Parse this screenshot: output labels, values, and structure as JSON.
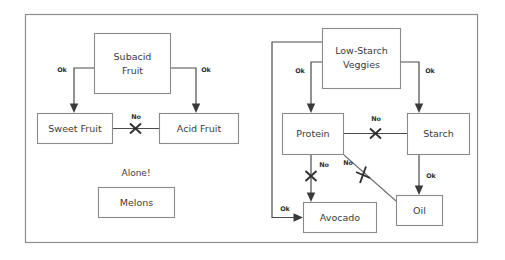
{
  "diagram": {
    "frame": {
      "x": 25,
      "y": 14,
      "width": 453,
      "height": 229
    },
    "colors": {
      "background": "#ffffff",
      "frame_border": "#8d8d8d",
      "node_border": "#8a8a8a",
      "node_fill": "#ffffff",
      "connector": "#4a4a4a",
      "text": "#3b3b3b",
      "mark": "#2f2f2f"
    },
    "nodes": [
      {
        "id": "subacid-fruit",
        "label": "Subacid\nFruit",
        "line1": "Subacid",
        "line2": "Fruit",
        "x": 94,
        "y": 33,
        "width": 77,
        "height": 61
      },
      {
        "id": "sweet-fruit",
        "label": "Sweet Fruit",
        "line1": "Sweet Fruit",
        "line2": "",
        "x": 37,
        "y": 113,
        "width": 76,
        "height": 31
      },
      {
        "id": "acid-fruit",
        "label": "Acid Fruit",
        "line1": "Acid Fruit",
        "line2": "",
        "x": 159,
        "y": 113,
        "width": 80,
        "height": 31
      },
      {
        "id": "melons",
        "label": "Melons",
        "line1": "Melons",
        "line2": "",
        "x": 98,
        "y": 187,
        "width": 77,
        "height": 31
      },
      {
        "id": "low-starch-veggies",
        "label": "Low-Starch\nVeggies",
        "line1": "Low-Starch",
        "line2": "Veggies",
        "x": 322,
        "y": 28,
        "width": 79,
        "height": 61
      },
      {
        "id": "protein",
        "label": "Protein",
        "line1": "Protein",
        "line2": "",
        "x": 282,
        "y": 113,
        "width": 62,
        "height": 42
      },
      {
        "id": "starch",
        "label": "Starch",
        "line1": "Starch",
        "line2": "",
        "x": 407,
        "y": 113,
        "width": 63,
        "height": 42
      },
      {
        "id": "avocado",
        "label": "Avocado",
        "line1": "Avocado",
        "line2": "",
        "x": 303,
        "y": 202,
        "width": 74,
        "height": 31
      },
      {
        "id": "oil",
        "label": "Oil",
        "line1": "Oil",
        "line2": "",
        "x": 396,
        "y": 195,
        "width": 47,
        "height": 31
      }
    ],
    "standalone_note": {
      "text": "Alone!",
      "x": 136,
      "y": 173
    },
    "edges": [
      {
        "id": "subacid-to-sweet",
        "from": "subacid-fruit",
        "to": "sweet-fruit",
        "label": "Ok",
        "verdict": "ok",
        "label_x": 62,
        "label_y": 70
      },
      {
        "id": "subacid-to-acid",
        "from": "subacid-fruit",
        "to": "acid-fruit",
        "label": "Ok",
        "verdict": "ok",
        "label_x": 206,
        "label_y": 70
      },
      {
        "id": "sweet-to-acid",
        "from": "sweet-fruit",
        "to": "acid-fruit",
        "label": "No",
        "verdict": "no",
        "label_x": 136,
        "label_y": 117
      },
      {
        "id": "veggies-to-protein",
        "from": "low-starch-veggies",
        "to": "protein",
        "label": "Ok",
        "verdict": "ok",
        "label_x": 300,
        "label_y": 71
      },
      {
        "id": "veggies-to-starch",
        "from": "low-starch-veggies",
        "to": "starch",
        "label": "Ok",
        "verdict": "ok",
        "label_x": 428,
        "label_y": 71
      },
      {
        "id": "veggies-to-avocado",
        "from": "low-starch-veggies",
        "to": "avocado",
        "label": "Ok",
        "verdict": "ok",
        "label_x": 285,
        "label_y": 209
      },
      {
        "id": "protein-to-starch",
        "from": "protein",
        "to": "starch",
        "label": "No",
        "verdict": "no",
        "label_x": 376,
        "label_y": 119
      },
      {
        "id": "protein-to-avocado",
        "from": "protein",
        "to": "avocado",
        "label": "No",
        "verdict": "no",
        "label_x": 324,
        "label_y": 165
      },
      {
        "id": "protein-to-oil",
        "from": "protein",
        "to": "oil",
        "label": "No",
        "verdict": "no",
        "label_x": 347,
        "label_y": 163
      },
      {
        "id": "starch-to-oil",
        "from": "starch",
        "to": "oil",
        "label": "Ok",
        "verdict": "ok",
        "label_x": 431,
        "label_y": 176
      }
    ]
  }
}
